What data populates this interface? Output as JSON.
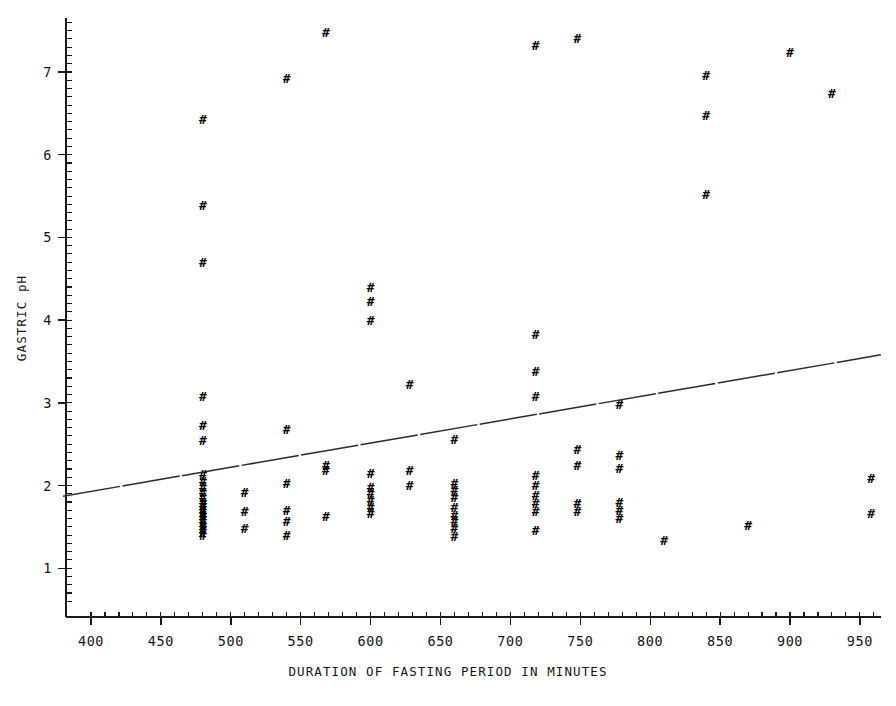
{
  "chart_data": {
    "type": "scatter",
    "title": "",
    "xlabel": "DURATION OF FASTING PERIOD IN MINUTES",
    "ylabel": "GASTRIC pH",
    "xlim": [
      380,
      965
    ],
    "ylim": [
      0.55,
      7.65
    ],
    "grid": false,
    "legend": null,
    "marker_glyph": "#",
    "marker_name": "hash-marker",
    "xticks": [
      400,
      450,
      500,
      550,
      600,
      650,
      700,
      750,
      800,
      850,
      900,
      950
    ],
    "xtick_labels": [
      "400",
      "450",
      "500",
      "550",
      "600",
      "650",
      "700",
      "750",
      "800",
      "850",
      "900",
      "950"
    ],
    "yticks": [
      1,
      2,
      3,
      4,
      5,
      6,
      7
    ],
    "ytick_labels": [
      "1",
      "2",
      "3",
      "4",
      "5",
      "6",
      "7"
    ],
    "minor_tick_step_x": 10,
    "minor_tick_step_y": 0.1,
    "trend_line": {
      "name": "least-squares-fit",
      "x_start": 380,
      "y_start": 1.87,
      "x_end": 965,
      "y_end": 3.58,
      "slope_per_minute": 0.00292,
      "style": "dashed"
    },
    "points": [
      {
        "x": 480,
        "y": 6.42
      },
      {
        "x": 480,
        "y": 5.38
      },
      {
        "x": 480,
        "y": 4.7
      },
      {
        "x": 480,
        "y": 3.08
      },
      {
        "x": 480,
        "y": 2.72
      },
      {
        "x": 480,
        "y": 2.55
      },
      {
        "x": 480,
        "y": 2.13
      },
      {
        "x": 480,
        "y": 2.05
      },
      {
        "x": 480,
        "y": 1.98
      },
      {
        "x": 480,
        "y": 1.92
      },
      {
        "x": 480,
        "y": 1.86
      },
      {
        "x": 480,
        "y": 1.8
      },
      {
        "x": 480,
        "y": 1.76
      },
      {
        "x": 480,
        "y": 1.72
      },
      {
        "x": 480,
        "y": 1.68
      },
      {
        "x": 480,
        "y": 1.64
      },
      {
        "x": 480,
        "y": 1.6
      },
      {
        "x": 480,
        "y": 1.56
      },
      {
        "x": 480,
        "y": 1.52
      },
      {
        "x": 480,
        "y": 1.48
      },
      {
        "x": 480,
        "y": 1.44
      },
      {
        "x": 480,
        "y": 1.4
      },
      {
        "x": 510,
        "y": 1.92
      },
      {
        "x": 510,
        "y": 1.68
      },
      {
        "x": 510,
        "y": 1.48
      },
      {
        "x": 540,
        "y": 6.92
      },
      {
        "x": 540,
        "y": 2.68
      },
      {
        "x": 540,
        "y": 2.02
      },
      {
        "x": 540,
        "y": 1.7
      },
      {
        "x": 540,
        "y": 1.56
      },
      {
        "x": 540,
        "y": 1.4
      },
      {
        "x": 568,
        "y": 7.48
      },
      {
        "x": 568,
        "y": 2.24
      },
      {
        "x": 568,
        "y": 2.18
      },
      {
        "x": 568,
        "y": 1.62
      },
      {
        "x": 600,
        "y": 4.4
      },
      {
        "x": 600,
        "y": 4.22
      },
      {
        "x": 600,
        "y": 4.0
      },
      {
        "x": 600,
        "y": 2.14
      },
      {
        "x": 600,
        "y": 1.98
      },
      {
        "x": 600,
        "y": 1.9
      },
      {
        "x": 600,
        "y": 1.82
      },
      {
        "x": 600,
        "y": 1.74
      },
      {
        "x": 600,
        "y": 1.66
      },
      {
        "x": 628,
        "y": 3.22
      },
      {
        "x": 628,
        "y": 2.18
      },
      {
        "x": 628,
        "y": 2.0
      },
      {
        "x": 660,
        "y": 2.56
      },
      {
        "x": 660,
        "y": 2.02
      },
      {
        "x": 660,
        "y": 1.94
      },
      {
        "x": 660,
        "y": 1.86
      },
      {
        "x": 660,
        "y": 1.74
      },
      {
        "x": 660,
        "y": 1.64
      },
      {
        "x": 660,
        "y": 1.56
      },
      {
        "x": 660,
        "y": 1.48
      },
      {
        "x": 660,
        "y": 1.38
      },
      {
        "x": 718,
        "y": 7.32
      },
      {
        "x": 718,
        "y": 3.82
      },
      {
        "x": 718,
        "y": 3.38
      },
      {
        "x": 718,
        "y": 3.08
      },
      {
        "x": 718,
        "y": 2.12
      },
      {
        "x": 718,
        "y": 2.0
      },
      {
        "x": 718,
        "y": 1.88
      },
      {
        "x": 718,
        "y": 1.78
      },
      {
        "x": 718,
        "y": 1.68
      },
      {
        "x": 718,
        "y": 1.46
      },
      {
        "x": 748,
        "y": 7.4
      },
      {
        "x": 748,
        "y": 2.44
      },
      {
        "x": 748,
        "y": 2.24
      },
      {
        "x": 748,
        "y": 1.78
      },
      {
        "x": 748,
        "y": 1.68
      },
      {
        "x": 778,
        "y": 2.98
      },
      {
        "x": 778,
        "y": 2.36
      },
      {
        "x": 778,
        "y": 2.2
      },
      {
        "x": 778,
        "y": 1.8
      },
      {
        "x": 778,
        "y": 1.7
      },
      {
        "x": 778,
        "y": 1.6
      },
      {
        "x": 810,
        "y": 1.34
      },
      {
        "x": 840,
        "y": 6.96
      },
      {
        "x": 840,
        "y": 6.48
      },
      {
        "x": 840,
        "y": 5.52
      },
      {
        "x": 870,
        "y": 1.52
      },
      {
        "x": 900,
        "y": 7.24
      },
      {
        "x": 930,
        "y": 6.74
      },
      {
        "x": 958,
        "y": 2.08
      },
      {
        "x": 958,
        "y": 1.66
      }
    ]
  }
}
